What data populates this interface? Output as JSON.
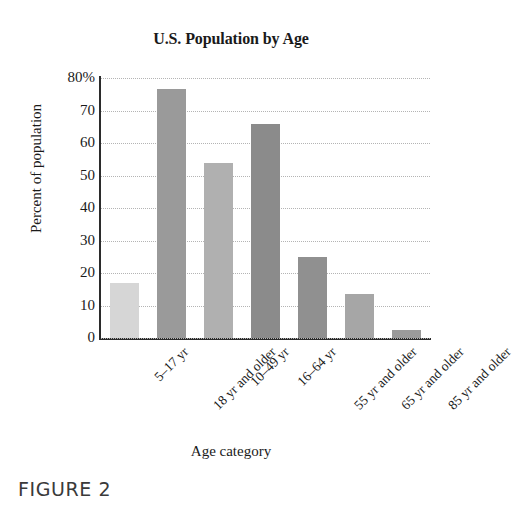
{
  "figure": {
    "caption": "FIGURE 2"
  },
  "chart_data": {
    "type": "bar",
    "title": "U.S. Population by Age",
    "xlabel": "Age category",
    "ylabel": "Percent of population",
    "categories": [
      "5–17 yr",
      "18 yr and older",
      "10–49 yr",
      "16–64 yr",
      "55 yr and older",
      "65 yr and older",
      "85 yr and older"
    ],
    "values": [
      17,
      76.5,
      54,
      66,
      25,
      13.5,
      2.5
    ],
    "bar_colors": [
      "#d6d6d6",
      "#9a9a9a",
      "#b0b0b0",
      "#8b8b8b",
      "#909090",
      "#a6a6a6",
      "#9a9a9a"
    ],
    "ylim": [
      0,
      80
    ],
    "yticks": [
      0,
      10,
      20,
      30,
      40,
      50,
      60,
      70,
      80
    ],
    "ytick_labels": [
      "0",
      "10",
      "20",
      "30",
      "40",
      "50",
      "60",
      "70",
      "80%"
    ],
    "grid": true,
    "grid_color": "#b4b4b4",
    "legend": null,
    "axis_color": "#2b2b2b",
    "background": "#ffffff"
  }
}
